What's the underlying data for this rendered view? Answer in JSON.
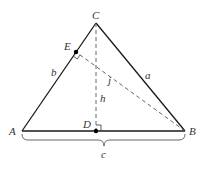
{
  "diagram": {
    "type": "triangle-altitudes",
    "colors": {
      "stroke": "#1a1a1a",
      "dashed": "#555555",
      "label": "#333333",
      "point": "#000000",
      "background": "#ffffff"
    },
    "vertices": {
      "A": {
        "label": "A",
        "x": 22,
        "y": 131
      },
      "B": {
        "label": "B",
        "x": 185,
        "y": 131
      },
      "C": {
        "label": "C",
        "x": 96,
        "y": 23
      }
    },
    "feet": {
      "D": {
        "label": "D",
        "x": 96,
        "y": 131,
        "description": "foot of altitude from C onto AB"
      },
      "E": {
        "label": "E",
        "x": 76,
        "y": 52,
        "description": "foot of perpendicular from B onto AC"
      }
    },
    "sides": {
      "a": {
        "label": "a",
        "from": "C",
        "to": "B"
      },
      "b": {
        "label": "b",
        "from": "A",
        "to": "C"
      },
      "c": {
        "label": "c",
        "from": "A",
        "to": "B",
        "brace": true
      }
    },
    "segments": {
      "h": {
        "label": "h",
        "from": "C",
        "to": "D",
        "style": "dashed"
      },
      "j": {
        "label": "j",
        "from": "B",
        "to": "E",
        "style": "dashed"
      }
    },
    "right_angle_marks": [
      "D",
      "E"
    ]
  }
}
